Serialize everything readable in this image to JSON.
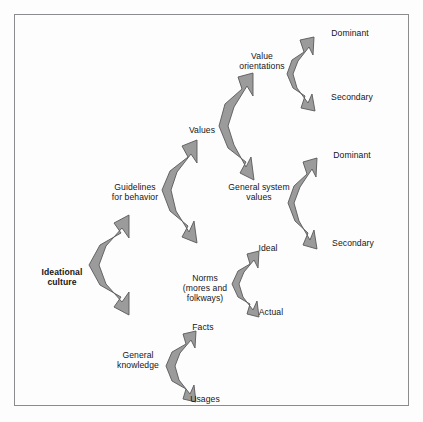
{
  "figure": {
    "frame": {
      "border_color": "#8c8c8e",
      "background": "#fdfdfd"
    },
    "arrow_style": {
      "fill": "#9b9b9b",
      "stroke": "#59595b",
      "shape": "double-headed-bracket-arrow"
    }
  },
  "nodes": [
    {
      "id": "ideational-culture",
      "label": "Ideational\nculture",
      "x": 62,
      "y": 277,
      "bold": true,
      "align": "center"
    },
    {
      "id": "guidelines-for-behavior",
      "label": "Guidelines\nfor behavior",
      "x": 135,
      "y": 192,
      "bold": false,
      "align": "center"
    },
    {
      "id": "general-knowledge",
      "label": "General\nknowledge",
      "x": 138,
      "y": 360,
      "bold": false,
      "align": "center"
    },
    {
      "id": "values",
      "label": "Values",
      "x": 202,
      "y": 130,
      "bold": false,
      "align": "center"
    },
    {
      "id": "norms",
      "label": "Norms\n(mores and\nfolkways)",
      "x": 205,
      "y": 288,
      "bold": false,
      "align": "center"
    },
    {
      "id": "facts",
      "label": "Facts",
      "x": 203,
      "y": 327,
      "bold": false,
      "align": "center"
    },
    {
      "id": "usages",
      "label": "Usages",
      "x": 205,
      "y": 399,
      "bold": false,
      "align": "center"
    },
    {
      "id": "value-orientations",
      "label": "Value\norientations",
      "x": 262,
      "y": 61,
      "bold": false,
      "align": "center"
    },
    {
      "id": "general-system-values",
      "label": "General system\nvalues",
      "x": 259,
      "y": 192,
      "bold": false,
      "align": "center"
    },
    {
      "id": "ideal",
      "label": "Ideal",
      "x": 268,
      "y": 248,
      "bold": false,
      "align": "center"
    },
    {
      "id": "actual",
      "label": "Actual",
      "x": 271,
      "y": 312,
      "bold": false,
      "align": "center"
    },
    {
      "id": "dominant-top",
      "label": "Dominant",
      "x": 350,
      "y": 33,
      "bold": false,
      "align": "center"
    },
    {
      "id": "secondary-top",
      "label": "Secondary",
      "x": 352,
      "y": 97,
      "bold": false,
      "align": "center"
    },
    {
      "id": "dominant-middle",
      "label": "Dominant",
      "x": 352,
      "y": 155,
      "bold": false,
      "align": "center"
    },
    {
      "id": "secondary-middle",
      "label": "Secondary",
      "x": 353,
      "y": 243,
      "bold": false,
      "align": "center"
    }
  ],
  "connectors": [
    {
      "id": "ideational-to-branches",
      "from": "ideational-culture",
      "to": [
        "guidelines-for-behavior",
        "general-knowledge"
      ]
    },
    {
      "id": "guidelines-to-branches",
      "from": "guidelines-for-behavior",
      "to": [
        "values",
        "norms"
      ]
    },
    {
      "id": "knowledge-to-branches",
      "from": "general-knowledge",
      "to": [
        "facts",
        "usages"
      ]
    },
    {
      "id": "values-to-branches",
      "from": "values",
      "to": [
        "value-orientations",
        "general-system-values"
      ]
    },
    {
      "id": "norms-to-branches",
      "from": "norms",
      "to": [
        "ideal",
        "actual"
      ]
    },
    {
      "id": "orientations-to-branches",
      "from": "value-orientations",
      "to": [
        "dominant-top",
        "secondary-top"
      ]
    },
    {
      "id": "system-values-to-branches",
      "from": "general-system-values",
      "to": [
        "dominant-middle",
        "secondary-middle"
      ]
    }
  ]
}
